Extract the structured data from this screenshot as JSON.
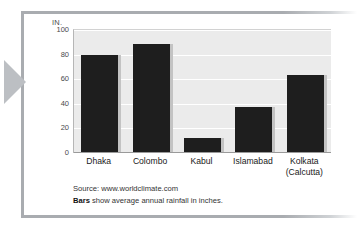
{
  "figure": {
    "unit_label": "IN.",
    "source": "Source: www.worldclimate.com",
    "caption_strong": "Bars",
    "caption_rest": " show average annual rainfall in inches."
  },
  "chart_data": {
    "type": "bar",
    "title": "",
    "xlabel": "",
    "ylabel": "IN.",
    "ylim": [
      0,
      100
    ],
    "yticks": [
      0,
      20,
      40,
      60,
      80,
      100
    ],
    "ytick_labels": [
      "0",
      "20",
      "40",
      "60",
      "80",
      "100"
    ],
    "grid": true,
    "legend": "none",
    "bar_color": "#1e1e1e",
    "plot_background": "#ebebeb",
    "categories": [
      "Dhaka",
      "Colombo",
      "Kabul",
      "Islamabad",
      "Kolkata (Calcutta)"
    ],
    "category_lines": [
      [
        "Dhaka"
      ],
      [
        "Colombo"
      ],
      [
        "Kabul"
      ],
      [
        "Islamabad"
      ],
      [
        "Kolkata",
        "(Calcutta)"
      ]
    ],
    "values": [
      79,
      88,
      11,
      37,
      63
    ],
    "annotation": "Bars show average annual rainfall in inches."
  }
}
